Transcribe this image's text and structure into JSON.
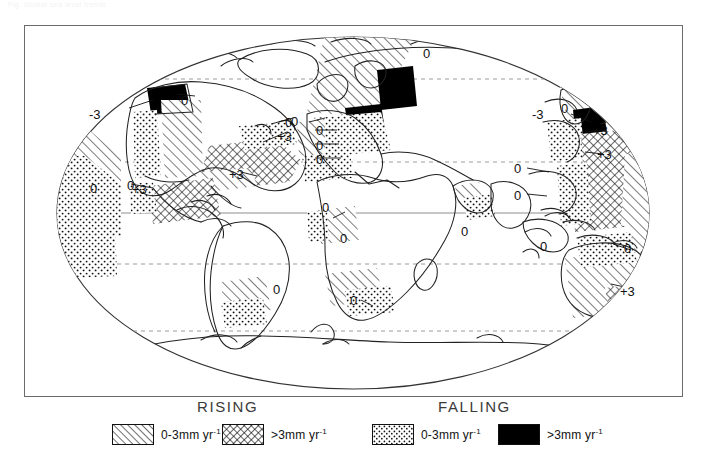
{
  "figure": {
    "faint_header": "Fig. Global sea level trends",
    "frame": {
      "x": 24,
      "y": 25,
      "w": 659,
      "h": 372
    }
  },
  "map": {
    "projection": "elliptical (Mollweide-like) world projection",
    "graticule": {
      "equator": {
        "style": "solid",
        "y": 212
      },
      "tropics": [
        {
          "name": "tropic-of-cancer",
          "style": "dashed",
          "y": 161
        },
        {
          "name": "tropic-of-capricorn",
          "style": "dashed",
          "y": 263
        }
      ],
      "polar": [
        {
          "name": "arctic-circle",
          "style": "dashed",
          "y": 78
        },
        {
          "name": "antarctic-circle",
          "style": "dashed",
          "y": 330
        }
      ]
    },
    "annotations": [
      {
        "label": "-3",
        "x": 88,
        "y": 106
      },
      {
        "label": "0",
        "x": 180,
        "y": 92
      },
      {
        "label": "0",
        "x": 284,
        "y": 114
      },
      {
        "label": "+3",
        "x": 276,
        "y": 128
      },
      {
        "label": "0",
        "x": 89,
        "y": 180
      },
      {
        "label": "0",
        "x": 126,
        "y": 177
      },
      {
        "label": "+3",
        "x": 131,
        "y": 181
      },
      {
        "label": "+3",
        "x": 228,
        "y": 166
      },
      {
        "label": "0",
        "x": 290,
        "y": 113
      },
      {
        "label": "0",
        "x": 315,
        "y": 122
      },
      {
        "label": "0",
        "x": 315,
        "y": 137
      },
      {
        "label": "0",
        "x": 315,
        "y": 151
      },
      {
        "label": "0",
        "x": 422,
        "y": 45
      },
      {
        "label": "0",
        "x": 321,
        "y": 199
      },
      {
        "label": "0",
        "x": 339,
        "y": 230
      },
      {
        "label": "0",
        "x": 349,
        "y": 292
      },
      {
        "label": "0",
        "x": 272,
        "y": 281
      },
      {
        "label": "0",
        "x": 460,
        "y": 223
      },
      {
        "label": "-3",
        "x": 531,
        "y": 106
      },
      {
        "label": "0",
        "x": 560,
        "y": 100
      },
      {
        "label": "+3",
        "x": 592,
        "y": 122
      },
      {
        "label": "+3",
        "x": 596,
        "y": 146
      },
      {
        "label": "0",
        "x": 513,
        "y": 160
      },
      {
        "label": "0",
        "x": 513,
        "y": 187
      },
      {
        "label": "0",
        "x": 539,
        "y": 238
      },
      {
        "label": "0",
        "x": 623,
        "y": 240
      },
      {
        "label": "+3",
        "x": 619,
        "y": 283
      }
    ],
    "symbols": {
      "hatch_light": "0-3 mm per year rising (diagonal line hatch)",
      "crosshatch": "more than 3 mm per year rising (cross hatch)",
      "stipple": "0-3 mm per year falling (dotted / stipple)",
      "solid_black": "more than 3 mm per year falling (solid fill)"
    }
  },
  "legend": {
    "titles": {
      "rising": "RISING",
      "falling": "FALLING"
    },
    "entries": [
      {
        "id": "rising-low",
        "pattern": "hatch",
        "label": "0-3mm  yr",
        "exponent": "-1"
      },
      {
        "id": "rising-high",
        "pattern": "crosshatch",
        "label": ">3mm  yr",
        "exponent": "-1"
      },
      {
        "id": "falling-low",
        "pattern": "stipple",
        "label": "0-3mm  yr",
        "exponent": "-1"
      },
      {
        "id": "falling-high",
        "pattern": "solid",
        "label": ">3mm  yr",
        "exponent": "-1"
      }
    ]
  },
  "colors": {
    "ink": "#111111",
    "frame": "#6b6b6b",
    "graticule": "#8d8d8d",
    "coast": "#222222",
    "title": "#3a3a3a"
  }
}
